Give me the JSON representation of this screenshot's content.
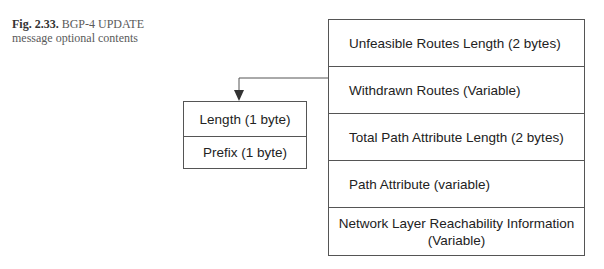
{
  "caption": {
    "label": "Fig. 2.33.",
    "text": " BGP-4 UPDATE message optional contents"
  },
  "message_fields": [
    {
      "label": "Unfeasible Routes Length (2 bytes)"
    },
    {
      "label": "Withdrawn Routes (Variable)"
    },
    {
      "label": "Total Path Attribute Length (2 bytes)"
    },
    {
      "label": "Path Attribute (variable)"
    },
    {
      "label": "Network Layer Reachability Information",
      "label2": "(Variable)"
    }
  ],
  "withdrawn_route_structure": [
    {
      "label": "Length (1 byte)"
    },
    {
      "label": "Prefix (1 byte)"
    }
  ],
  "colors": {
    "line": "#555555",
    "text": "#222222"
  }
}
